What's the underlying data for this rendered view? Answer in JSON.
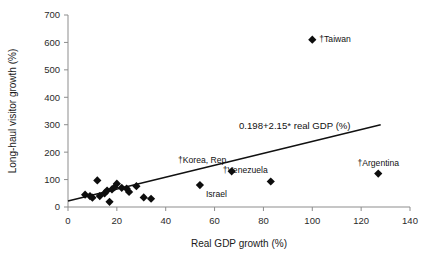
{
  "chart_data": {
    "type": "scatter",
    "title": "",
    "xlabel": "Real GDP growth (%)",
    "ylabel": "Long-haul visitor growth (%)",
    "xlim": [
      0,
      140
    ],
    "ylim": [
      0,
      700
    ],
    "xticks": [
      0,
      20,
      40,
      60,
      80,
      100,
      120,
      140
    ],
    "yticks": [
      0,
      100,
      200,
      300,
      400,
      500,
      600,
      700
    ],
    "xtick_labels": [
      "0",
      "20",
      "40",
      "60",
      "80",
      "100",
      "120",
      "140"
    ],
    "ytick_labels": [
      "0",
      "100",
      "200",
      "300",
      "400",
      "500",
      "600",
      "700"
    ],
    "grid": false,
    "legend": null,
    "marker": "diamond",
    "marker_color": "#0d0d0d",
    "annotations": [
      {
        "name": "regression-equation",
        "text": "0.198+2.15* real GDP (%)",
        "x": 70,
        "y": 285
      }
    ],
    "fit_line": {
      "label": "0.198+2.15* real GDP (%)",
      "intercept": 0.198,
      "slope": 2.15,
      "x_start": 0,
      "x_end": 128,
      "y_start": 22,
      "y_end": 300
    },
    "points": [
      {
        "x": 7,
        "y": 45,
        "label": ""
      },
      {
        "x": 9,
        "y": 40,
        "label": ""
      },
      {
        "x": 10,
        "y": 34,
        "label": ""
      },
      {
        "x": 12,
        "y": 97,
        "label": ""
      },
      {
        "x": 13,
        "y": 40,
        "label": ""
      },
      {
        "x": 15,
        "y": 50,
        "label": ""
      },
      {
        "x": 16,
        "y": 60,
        "label": ""
      },
      {
        "x": 17,
        "y": 19,
        "label": ""
      },
      {
        "x": 18,
        "y": 64,
        "label": ""
      },
      {
        "x": 19,
        "y": 72,
        "label": ""
      },
      {
        "x": 20,
        "y": 85,
        "label": ""
      },
      {
        "x": 22,
        "y": 70,
        "label": ""
      },
      {
        "x": 24,
        "y": 67,
        "label": ""
      },
      {
        "x": 25,
        "y": 55,
        "label": ""
      },
      {
        "x": 28,
        "y": 76,
        "label": ""
      },
      {
        "x": 31,
        "y": 35,
        "label": ""
      },
      {
        "x": 34,
        "y": 30,
        "label": ""
      },
      {
        "x": 54,
        "y": 80,
        "label": "Israel",
        "label_pos": "below-right"
      },
      {
        "x": 67,
        "y": 130,
        "label": "†Korea, Rep.",
        "label_pos": "above-left"
      },
      {
        "x": 83,
        "y": 93,
        "label": "†Venezuela",
        "label_pos": "above-left"
      },
      {
        "x": 100,
        "y": 610,
        "label": "†Taiwan",
        "label_pos": "right"
      },
      {
        "x": 127,
        "y": 122,
        "label": "†Argentina",
        "label_pos": "above"
      }
    ]
  }
}
